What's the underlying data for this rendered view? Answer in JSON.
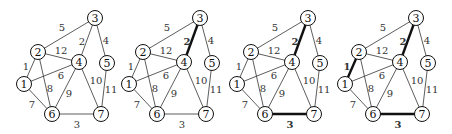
{
  "diagram": {
    "title": "",
    "colors": {
      "line": "#333333",
      "bold_line": "#111111",
      "node_fill": "#ffffff",
      "text": "#333333"
    },
    "nodes": [
      {
        "id": "1",
        "x": 24,
        "y": 84
      },
      {
        "id": "2",
        "x": 38,
        "y": 52
      },
      {
        "id": "3",
        "x": 95,
        "y": 18
      },
      {
        "id": "4",
        "x": 79,
        "y": 62
      },
      {
        "id": "5",
        "x": 107,
        "y": 63
      },
      {
        "id": "6",
        "x": 52,
        "y": 114
      },
      {
        "id": "7",
        "x": 101,
        "y": 114
      }
    ],
    "edges": [
      {
        "from": "1",
        "to": "2",
        "weight": "1",
        "lx": 26,
        "ly": 66
      },
      {
        "from": "3",
        "to": "4",
        "weight": "2",
        "lx": 82,
        "ly": 41
      },
      {
        "from": "6",
        "to": "7",
        "weight": "3",
        "lx": 77,
        "ly": 124
      },
      {
        "from": "3",
        "to": "5",
        "weight": "4",
        "lx": 106,
        "ly": 40
      },
      {
        "from": "2",
        "to": "3",
        "weight": "5",
        "lx": 62,
        "ly": 27
      },
      {
        "from": "1",
        "to": "4",
        "weight": "6",
        "lx": 61,
        "ly": 75
      },
      {
        "from": "1",
        "to": "6",
        "weight": "7",
        "lx": 32,
        "ly": 104
      },
      {
        "from": "2",
        "to": "6",
        "weight": "8",
        "lx": 50,
        "ly": 88
      },
      {
        "from": "4",
        "to": "6",
        "weight": "9",
        "lx": 69,
        "ly": 93
      },
      {
        "from": "4",
        "to": "7",
        "weight": "10",
        "lx": 96,
        "ly": 80
      },
      {
        "from": "5",
        "to": "7",
        "weight": "11",
        "lx": 111,
        "ly": 89
      },
      {
        "from": "2",
        "to": "4",
        "weight": "12",
        "lx": 61,
        "ly": 50
      }
    ],
    "panels": [
      {
        "step": 1,
        "offset_x": 0,
        "bold_edges": []
      },
      {
        "step": 2,
        "offset_x": 105,
        "bold_edges": [
          "3-4"
        ]
      },
      {
        "step": 3,
        "offset_x": 213,
        "bold_edges": [
          "3-4",
          "6-7"
        ]
      },
      {
        "step": 4,
        "offset_x": 321,
        "bold_edges": [
          "3-4",
          "6-7",
          "1-2"
        ]
      }
    ]
  }
}
